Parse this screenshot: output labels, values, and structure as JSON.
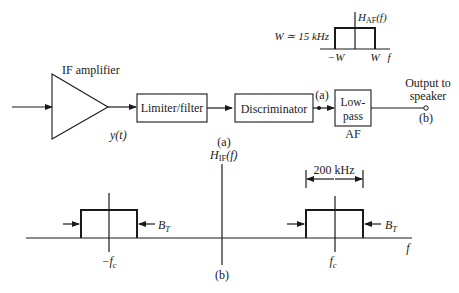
{
  "part_a": {
    "caption": "(a)",
    "blocks": {
      "if_amplifier": "IF amplifier",
      "limiter_filter": "Limiter/filter",
      "discriminator": "Discriminator",
      "lowpass_line1": "Low-",
      "lowpass_line2": "pass",
      "lowpass_sub": "AF"
    },
    "signals": {
      "amp_output": "y(t)",
      "node_a": "(a)",
      "output_line1": "Output to",
      "output_line2": "speaker",
      "node_b": "(b)"
    },
    "af_response": {
      "title_main": "H",
      "title_sub": "AF",
      "title_arg": "(f)",
      "bandwidth_label": "W ≃ 15 kHz",
      "tick_neg": "−W",
      "tick_pos": "W",
      "axis_label": "f"
    }
  },
  "part_b": {
    "caption": "(b)",
    "title_main": "H",
    "title_sub": "IF",
    "title_arg": "(f)",
    "bandwidth_span": "200 kHz",
    "neg_center": "−f",
    "neg_center_sub": "c",
    "pos_center": "f",
    "pos_center_sub": "c",
    "bt_main": "B",
    "bt_sub": "T",
    "axis_label": "f"
  }
}
